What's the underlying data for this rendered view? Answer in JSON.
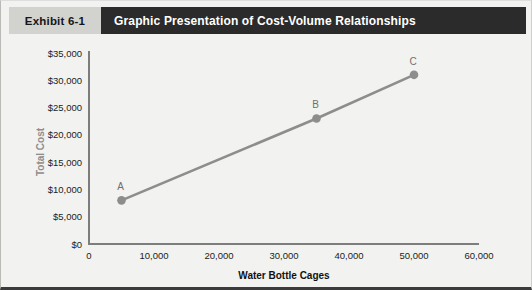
{
  "exhibit": {
    "tag": "Exhibit 6-1",
    "title": "Graphic Presentation of Cost-Volume Relationships"
  },
  "colors": {
    "header_tag_bg": "#d2d2cf",
    "header_title_bg": "#2b2b2b",
    "header_title_text": "#ffffff",
    "page_bg": "#f2f2f0",
    "series": "#8d8d8d",
    "axis": "#7d7d7d",
    "y_axis_title": "#8e8e8e",
    "x_axis_title": "#111111",
    "point_label": "#6f6f6f"
  },
  "chart_data": {
    "type": "line",
    "title": "Graphic Presentation of Cost-Volume Relationships",
    "xlabel": "Water Bottle Cages",
    "ylabel": "Total Cost",
    "xlim": [
      0,
      60000
    ],
    "ylim": [
      0,
      35000
    ],
    "grid": false,
    "legend": false,
    "xticks": [
      0,
      10000,
      20000,
      30000,
      40000,
      50000,
      60000
    ],
    "xticklabels": [
      "0",
      "10,000",
      "20,000",
      "30,000",
      "40,000",
      "50,000",
      "60,000"
    ],
    "yticks": [
      0,
      5000,
      10000,
      15000,
      20000,
      25000,
      30000,
      35000
    ],
    "yticklabels": [
      "$0",
      "$5,000",
      "$10,000",
      "$15,000",
      "$20,000",
      "$25,000",
      "$30,000",
      "$35,000"
    ],
    "series": [
      {
        "name": "Total Cost",
        "x": [
          5000,
          35000,
          50000
        ],
        "y": [
          8000,
          23000,
          31000
        ],
        "point_labels": [
          "A",
          "B",
          "C"
        ],
        "marker": "circle",
        "color": "#8d8d8d"
      }
    ],
    "annotations": [
      {
        "label": "A",
        "x": 5000,
        "y": 8000
      },
      {
        "label": "B",
        "x": 35000,
        "y": 23000
      },
      {
        "label": "C",
        "x": 50000,
        "y": 31000
      }
    ]
  }
}
